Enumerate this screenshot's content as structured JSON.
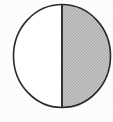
{
  "figure": {
    "name": "half-shaded-circle",
    "shape": "circle",
    "total_parts": 2,
    "shaded_parts": 1,
    "fraction_shaded": "1/2",
    "left_half": {
      "label": "left-half",
      "state": "unshaded",
      "fill_color": "#ffffff"
    },
    "right_half": {
      "label": "right-half",
      "state": "shaded",
      "fill_color": "#bcbcbc"
    },
    "divider": {
      "label": "vertical-diameter",
      "orientation": "vertical",
      "color": "#222222"
    },
    "outline_color": "#2a2a2a",
    "background_color": "#fdfdfd"
  }
}
